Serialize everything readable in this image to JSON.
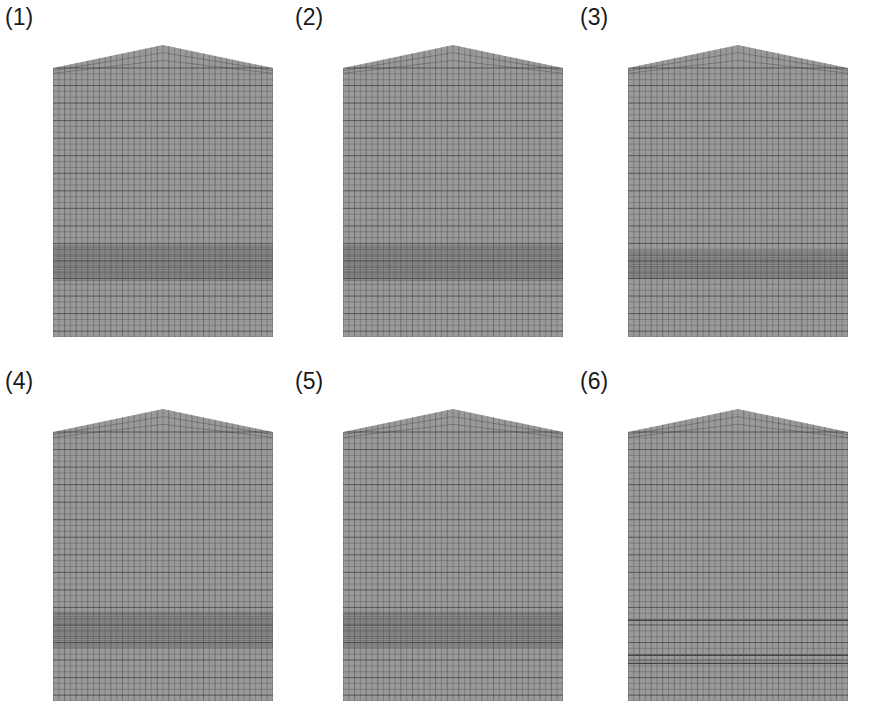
{
  "figure": {
    "mesh_color": "#9a9a9a",
    "line_color": "#3c3c3c",
    "panels": [
      {
        "label": "(1)",
        "x": 5,
        "y": 6,
        "dense_band": [
          0.66,
          0.79
        ],
        "band_density": 3,
        "extra_lines": []
      },
      {
        "label": "(2)",
        "x": 295,
        "y": 6,
        "dense_band": [
          0.66,
          0.79
        ],
        "band_density": 3,
        "extra_lines": []
      },
      {
        "label": "(3)",
        "x": 580,
        "y": 6,
        "dense_band": [
          0.68,
          0.78
        ],
        "band_density": 4,
        "extra_lines": []
      },
      {
        "label": "(4)",
        "x": 5,
        "y": 370,
        "dense_band": [
          0.67,
          0.8
        ],
        "band_density": 3,
        "extra_lines": []
      },
      {
        "label": "(5)",
        "x": 295,
        "y": 370,
        "dense_band": [
          0.67,
          0.8
        ],
        "band_density": 3,
        "extra_lines": []
      },
      {
        "label": "(6)",
        "x": 580,
        "y": 370,
        "dense_band": null,
        "band_density": 0,
        "extra_lines": [
          0.7,
          0.83,
          0.86
        ]
      }
    ]
  }
}
